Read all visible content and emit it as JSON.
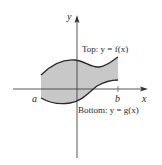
{
  "diagram": {
    "type": "region-between-curves",
    "axes": {
      "x_label": "x",
      "y_label": "y"
    },
    "bounds": {
      "left_label": "a",
      "right_label": "b"
    },
    "curves": {
      "top_label": "Top: y = f(x)",
      "bottom_label": "Bottom: y = g(x)"
    },
    "colors": {
      "fill": "#c8c8c8",
      "stroke": "#2a2a2a",
      "axis": "#444444"
    }
  }
}
